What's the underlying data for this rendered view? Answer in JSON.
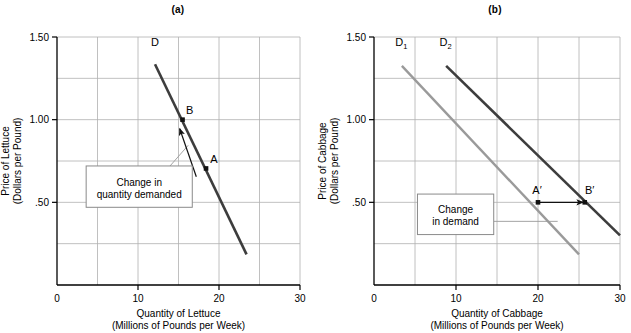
{
  "figure": {
    "panels": [
      {
        "id": "a",
        "title": "(a)",
        "y_axis": {
          "label_line1": "Price of Lettuce",
          "label_line2": "(Dollars per Pound)",
          "ticks": [
            "1.50",
            "1.00",
            ".50"
          ],
          "tick_values": [
            1.5,
            1.0,
            0.5
          ],
          "gridlines": [
            0.25,
            0.5,
            0.75,
            1.0,
            1.25,
            1.5
          ],
          "min": 0,
          "max": 1.5
        },
        "x_axis": {
          "label_line1": "Quantity of Lettuce",
          "label_line2": "(Millions of Pounds per Week)",
          "ticks": [
            "0",
            "10",
            "20",
            "30"
          ],
          "tick_values": [
            0,
            10,
            20,
            30
          ],
          "gridlines": [
            5,
            10,
            15,
            20,
            25,
            30
          ],
          "min": 0,
          "max": 30
        },
        "curves": [
          {
            "name": "D",
            "label": "D",
            "color": "#3d3d3d",
            "width": 2.6,
            "x1": 12.1,
            "y1": 1.335,
            "x2": 23.4,
            "y2": 0.185,
            "label_x": 11.6,
            "label_y": 1.445
          }
        ],
        "points": [
          {
            "name": "B",
            "label": "B",
            "x": 15.5,
            "y": 1.0,
            "label_dx": 7,
            "label_dy": -6
          },
          {
            "name": "A",
            "label": "A",
            "x": 18.4,
            "y": 0.705,
            "label_dx": 8,
            "label_dy": -5
          }
        ],
        "arrow": {
          "name": "movement-along-curve-arrow",
          "from_x": 17.2,
          "from_y": 0.655,
          "to_x": 15.15,
          "to_y": 0.945
        },
        "callout": {
          "name": "change-in-quantity-demanded-callout",
          "line1": "Change in",
          "line2": "quantity demanded",
          "box_x": 3.6,
          "box_y": 0.47,
          "box_w": 13.1,
          "box_h": 0.25,
          "leader_from_x": 10.0,
          "leader_from_y": 0.5,
          "leader_to_x": 16.2,
          "leader_to_y": 0.845
        }
      },
      {
        "id": "b",
        "title": "(b)",
        "y_axis": {
          "label_line1": "Price of Cabbage",
          "label_line2": "(Dollars per Pound)",
          "ticks": [
            "1.50",
            "1.00",
            ".50"
          ],
          "tick_values": [
            1.5,
            1.0,
            0.5
          ],
          "gridlines": [
            0.25,
            0.5,
            0.75,
            1.0,
            1.25,
            1.5
          ],
          "min": 0,
          "max": 1.5
        },
        "x_axis": {
          "label_line1": "Quantity of Cabbage",
          "label_line2": "(Millions of Pounds per Week)",
          "ticks": [
            "0",
            "10",
            "20",
            "30"
          ],
          "tick_values": [
            0,
            10,
            20,
            30
          ],
          "gridlines": [
            5,
            10,
            15,
            20,
            25,
            30
          ],
          "min": 0,
          "max": 30
        },
        "curves": [
          {
            "name": "D1",
            "label": "D",
            "sub": "1",
            "color": "#9a9a9a",
            "width": 2.4,
            "x1": 3.4,
            "y1": 1.325,
            "x2": 25.0,
            "y2": 0.185,
            "label_x": 2.6,
            "label_y": 1.445
          },
          {
            "name": "D2",
            "label": "D",
            "sub": "2",
            "color": "#3d3d3d",
            "width": 2.6,
            "x1": 8.8,
            "y1": 1.325,
            "x2": 30.0,
            "y2": 0.3,
            "label_x": 8.0,
            "label_y": 1.445
          }
        ],
        "points": [
          {
            "name": "A-prime",
            "label": "A′",
            "x": 20.0,
            "y": 0.5,
            "label_dx": -1,
            "label_dy": -8
          },
          {
            "name": "B-prime",
            "label": "B′",
            "x": 25.7,
            "y": 0.5,
            "label_dx": 5,
            "label_dy": -8
          }
        ],
        "arrow": {
          "name": "shift-of-curve-arrow",
          "from_x": 20.1,
          "from_y": 0.5,
          "to_x": 25.5,
          "to_y": 0.5
        },
        "callout": {
          "name": "change-in-demand-callout",
          "line1": "Change",
          "line2": "in demand",
          "box_x": 5.3,
          "box_y": 0.305,
          "box_w": 9.3,
          "box_h": 0.245,
          "leader_from_x": 14.6,
          "leader_from_y": 0.385,
          "leader_to_x": 22.4,
          "leader_to_y": 0.385
        }
      }
    ],
    "colors": {
      "axis": "#000000",
      "grid": "#b0b0b0",
      "curve_dark": "#3d3d3d",
      "curve_light": "#9a9a9a",
      "callout_border": "#8a8a8a",
      "leader": "#9a9a9a"
    }
  },
  "chart_data": {
    "type": "line",
    "panels": [
      {
        "label": "(a)",
        "title": "Change in quantity demanded (movement along demand curve)",
        "xlabel": "Quantity of Lettuce (Millions of Pounds per Week)",
        "ylabel": "Price of Lettuce (Dollars per Pound)",
        "xlim": [
          0,
          30
        ],
        "ylim": [
          0,
          1.5
        ],
        "xticks": [
          0,
          10,
          20,
          30
        ],
        "yticks": [
          0.5,
          1.0,
          1.5
        ],
        "ytick_labels": [
          ".50",
          "1.00",
          "1.50"
        ],
        "grid": true,
        "legend": "none",
        "series": [
          {
            "name": "D",
            "color": "#3d3d3d",
            "x": [
              12.1,
              23.4
            ],
            "y": [
              1.335,
              0.185
            ]
          }
        ],
        "annotations": [
          {
            "label": "B",
            "x": 15.5,
            "y": 1.0,
            "type": "point"
          },
          {
            "label": "A",
            "x": 18.4,
            "y": 0.705,
            "type": "point"
          },
          {
            "label": "Change in quantity demanded",
            "type": "callout",
            "x": 10.0,
            "y": 0.5
          },
          {
            "label": "arrow A to B along D",
            "type": "arrow",
            "x0": 17.2,
            "y0": 0.655,
            "x1": 15.15,
            "y1": 0.945
          }
        ]
      },
      {
        "label": "(b)",
        "title": "Change in demand (shift of demand curve)",
        "xlabel": "Quantity of Cabbage (Millions of Pounds per Week)",
        "ylabel": "Price of Cabbage (Dollars per Pound)",
        "xlim": [
          0,
          30
        ],
        "ylim": [
          0,
          1.5
        ],
        "xticks": [
          0,
          10,
          20,
          30
        ],
        "yticks": [
          0.5,
          1.0,
          1.5
        ],
        "ytick_labels": [
          ".50",
          "1.00",
          "1.50"
        ],
        "grid": true,
        "legend": "none",
        "series": [
          {
            "name": "D1",
            "color": "#9a9a9a",
            "x": [
              3.4,
              25.0
            ],
            "y": [
              1.325,
              0.185
            ]
          },
          {
            "name": "D2",
            "color": "#3d3d3d",
            "x": [
              8.8,
              30.0
            ],
            "y": [
              1.325,
              0.3
            ]
          }
        ],
        "annotations": [
          {
            "label": "A′",
            "x": 20.0,
            "y": 0.5,
            "type": "point"
          },
          {
            "label": "B′",
            "x": 25.7,
            "y": 0.5,
            "type": "point"
          },
          {
            "label": "Change in demand",
            "type": "callout",
            "x": 10.0,
            "y": 0.385
          },
          {
            "label": "arrow A' to B'",
            "type": "arrow",
            "x0": 20.1,
            "y0": 0.5,
            "x1": 25.5,
            "y1": 0.5
          }
        ]
      }
    ]
  }
}
